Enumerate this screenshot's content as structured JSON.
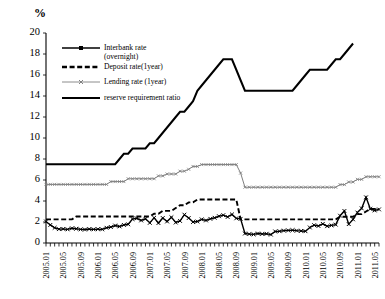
{
  "chart_data": {
    "type": "line",
    "title": "",
    "xlabel": "",
    "ylabel": "%",
    "ylim": [
      0,
      20
    ],
    "ytick_values": [
      0,
      2,
      4,
      6,
      8,
      10,
      12,
      14,
      16,
      18,
      20
    ],
    "grid": false,
    "legend_position": "upper-left",
    "x_axis_unit": "month",
    "x_tick_labels": [
      "2005.01",
      "2005.05",
      "2005.09",
      "2006.01",
      "2006.05",
      "2006.09",
      "2007.01",
      "2007.05",
      "2007.09",
      "2008.01",
      "2008.05",
      "2008.09",
      "2009.01",
      "2009.05",
      "2009.09",
      "2010.01",
      "2010.05",
      "2010.09",
      "2011.01",
      "2011.05"
    ],
    "x_tick_every_n_months": 4,
    "x_start": "2005.01",
    "x_end": "2011.06",
    "series": [
      {
        "name": "Interbank rate (overnight)",
        "style": "solid-marker-x",
        "color": "#000000",
        "values": [
          2.05,
          1.72,
          1.45,
          1.32,
          1.34,
          1.3,
          1.4,
          1.36,
          1.3,
          1.28,
          1.33,
          1.3,
          1.32,
          1.3,
          1.45,
          1.52,
          1.66,
          1.58,
          1.72,
          1.78,
          2.28,
          2.35,
          2.15,
          2.3,
          1.92,
          2.4,
          1.9,
          2.38,
          2.05,
          2.45,
          1.95,
          2.1,
          2.7,
          2.38,
          2.0,
          2.05,
          2.25,
          2.15,
          2.3,
          2.4,
          2.55,
          2.65,
          2.48,
          2.72,
          2.35,
          2.3,
          0.9,
          0.85,
          0.82,
          0.9,
          0.86,
          0.88,
          0.8,
          1.1,
          1.12,
          1.18,
          1.2,
          1.22,
          1.18,
          1.15,
          1.12,
          1.48,
          1.7,
          1.62,
          1.82,
          1.6,
          1.68,
          1.75,
          2.6,
          3.05,
          1.8,
          2.25,
          2.9,
          3.3,
          4.35,
          3.25,
          3.1,
          3.2
        ]
      },
      {
        "name": "Deposit rate(1year)",
        "style": "dashed",
        "color": "#000000",
        "values": [
          2.25,
          2.25,
          2.25,
          2.25,
          2.25,
          2.25,
          2.25,
          2.52,
          2.52,
          2.52,
          2.52,
          2.52,
          2.52,
          2.52,
          2.52,
          2.52,
          2.52,
          2.52,
          2.52,
          2.52,
          2.52,
          2.52,
          2.52,
          2.52,
          2.52,
          2.79,
          2.79,
          3.06,
          3.06,
          3.06,
          3.33,
          3.6,
          3.6,
          3.87,
          3.87,
          4.14,
          4.14,
          4.14,
          4.14,
          4.14,
          4.14,
          4.14,
          4.14,
          4.14,
          4.14,
          2.25,
          2.25,
          2.25,
          2.25,
          2.25,
          2.25,
          2.25,
          2.25,
          2.25,
          2.25,
          2.25,
          2.25,
          2.25,
          2.25,
          2.25,
          2.25,
          2.25,
          2.25,
          2.25,
          2.25,
          2.25,
          2.25,
          2.25,
          2.5,
          2.5,
          2.5,
          2.5,
          2.75,
          2.75,
          3.0,
          3.25,
          3.25,
          3.25
        ]
      },
      {
        "name": "Lending rate (1year)",
        "style": "solid-thin-marker",
        "color": "#7f7f7f",
        "values": [
          5.58,
          5.58,
          5.58,
          5.58,
          5.58,
          5.58,
          5.58,
          5.58,
          5.58,
          5.58,
          5.58,
          5.58,
          5.58,
          5.58,
          5.58,
          5.85,
          5.85,
          5.85,
          5.85,
          6.12,
          6.12,
          6.12,
          6.12,
          6.12,
          6.12,
          6.12,
          6.39,
          6.39,
          6.57,
          6.57,
          6.57,
          6.84,
          6.84,
          7.02,
          7.29,
          7.29,
          7.47,
          7.47,
          7.47,
          7.47,
          7.47,
          7.47,
          7.47,
          7.47,
          7.47,
          6.66,
          5.31,
          5.31,
          5.31,
          5.31,
          5.31,
          5.31,
          5.31,
          5.31,
          5.31,
          5.31,
          5.31,
          5.31,
          5.31,
          5.31,
          5.31,
          5.31,
          5.31,
          5.31,
          5.31,
          5.31,
          5.31,
          5.31,
          5.56,
          5.56,
          5.81,
          5.81,
          6.06,
          6.06,
          6.31,
          6.31,
          6.31,
          6.31
        ]
      },
      {
        "name": "reserve requirement ratio",
        "style": "solid-thick",
        "color": "#000000",
        "values": [
          7.5,
          7.5,
          7.5,
          7.5,
          7.5,
          7.5,
          7.5,
          7.5,
          7.5,
          7.5,
          7.5,
          7.5,
          7.5,
          7.5,
          7.5,
          7.5,
          7.5,
          8.0,
          8.5,
          8.5,
          9.0,
          9.0,
          9.0,
          9.0,
          9.5,
          9.5,
          10.0,
          10.5,
          11.0,
          11.5,
          12.0,
          12.5,
          12.5,
          13.0,
          13.5,
          14.5,
          15.0,
          15.5,
          16.0,
          16.5,
          17.0,
          17.5,
          17.5,
          17.5,
          16.5,
          15.5,
          14.5,
          14.5,
          14.5,
          14.5,
          14.5,
          14.5,
          14.5,
          14.5,
          14.5,
          14.5,
          14.5,
          14.5,
          15.0,
          15.5,
          16.0,
          16.5,
          16.5,
          16.5,
          16.5,
          16.5,
          17.0,
          17.5,
          17.5,
          18.0,
          18.5,
          19.0
        ]
      }
    ]
  },
  "legend": {
    "items": [
      {
        "label_line1": "Interbank rate",
        "label_line2": "(overnight)",
        "style": "solid-marker-x"
      },
      {
        "label_line1": "Deposit rate(1year)",
        "label_line2": "",
        "style": "dashed"
      },
      {
        "label_line1": "Lending rate (1year)",
        "label_line2": "",
        "style": "solid-thin-marker"
      },
      {
        "label_line1": "reserve requirement ratio",
        "label_line2": "",
        "style": "solid-thick"
      }
    ]
  },
  "axis": {
    "y_unit": "%"
  }
}
